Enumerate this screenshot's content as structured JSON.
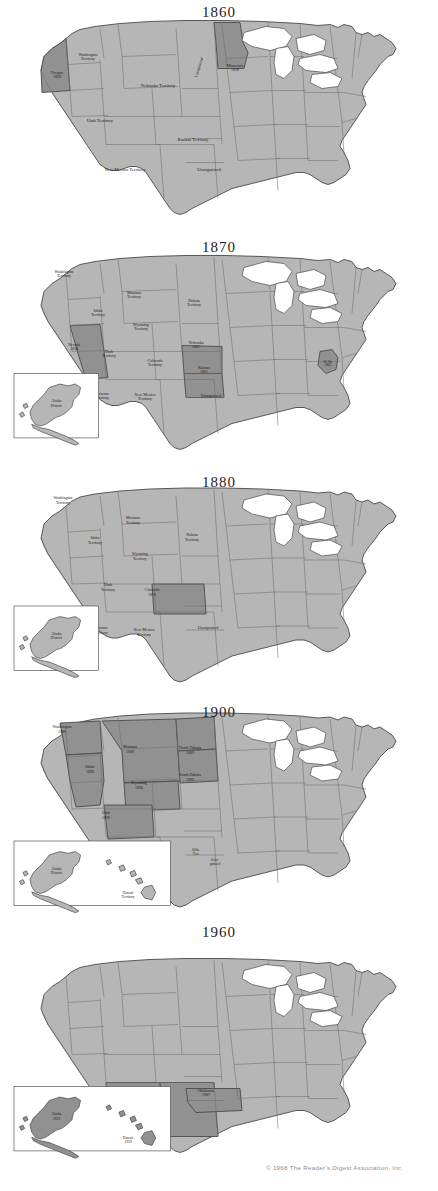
{
  "document": {
    "kind": "historical-map-series",
    "subject": "United States territorial and statehood expansion",
    "copyright": "© 1968 The Reader's Digest Association, Inc"
  },
  "colors": {
    "base_state_fill": "#b6b6b6",
    "highlight_fill": "#919191",
    "water_fill": "#ffffff",
    "border_stroke": "#6e6e6e",
    "outline_stroke": "#4a4a4a",
    "page_background": "#ffffff",
    "label_text": "#1c1c1c",
    "copyright_text": "#8d8d8d"
  },
  "maps": [
    {
      "id": "map-1860",
      "title": "1860",
      "has_alaska_inset": false,
      "has_hawaii_inset": false,
      "labels": [
        {
          "name": "washington-territory",
          "text": [
            "Washington",
            "Territory"
          ],
          "x": 88,
          "y": 42,
          "size": "xs",
          "highlight": false
        },
        {
          "name": "oregon",
          "text": [
            "Oregon",
            "1859"
          ],
          "x": 57,
          "y": 60,
          "size": "xs",
          "highlight": true
        },
        {
          "name": "nebraska-territory",
          "text": [
            "Nebraska Territory"
          ],
          "x": 158,
          "y": 73,
          "size": "sm",
          "highlight": false
        },
        {
          "name": "unorganized-vertical",
          "text": [
            "Unorganized"
          ],
          "x": 199,
          "y": 55,
          "size": "xs",
          "highlight": false,
          "rotate": -72
        },
        {
          "name": "minnesota",
          "text": [
            "Minnesota",
            "1858"
          ],
          "x": 235,
          "y": 53,
          "size": "xs",
          "highlight": true
        },
        {
          "name": "utah-territory",
          "text": [
            "Utah Territory"
          ],
          "x": 100,
          "y": 108,
          "size": "sm",
          "highlight": false
        },
        {
          "name": "kansas-territory",
          "text": [
            "Kansas Territory"
          ],
          "x": 193,
          "y": 127,
          "size": "sm",
          "highlight": false
        },
        {
          "name": "new-mexico-territory",
          "text": [
            "New Mexico Territory"
          ],
          "x": 125,
          "y": 157,
          "size": "sm",
          "highlight": false
        },
        {
          "name": "unorganized-south",
          "text": [
            "Unorganized"
          ],
          "x": 209,
          "y": 157,
          "size": "sm",
          "highlight": false
        }
      ]
    },
    {
      "id": "map-1870",
      "title": "1870",
      "has_alaska_inset": true,
      "has_hawaii_inset": false,
      "alaska_inset_label": [
        "Alaska",
        "District"
      ],
      "labels": [
        {
          "name": "washington-territory",
          "text": [
            "Washington",
            "Territory"
          ],
          "x": 64,
          "y": 24,
          "size": "xs",
          "highlight": false
        },
        {
          "name": "montana-territory",
          "text": [
            "Montana",
            "Territory"
          ],
          "x": 134,
          "y": 45,
          "size": "xs",
          "highlight": false
        },
        {
          "name": "dakota-territory",
          "text": [
            "Dakota",
            "Territory"
          ],
          "x": 194,
          "y": 53,
          "size": "xs",
          "highlight": false
        },
        {
          "name": "idaho-territory",
          "text": [
            "Idaho",
            "Territory"
          ],
          "x": 98,
          "y": 63,
          "size": "xs",
          "highlight": false
        },
        {
          "name": "wyoming-territory",
          "text": [
            "Wyoming",
            "Territory"
          ],
          "x": 141,
          "y": 77,
          "size": "xs",
          "highlight": false
        },
        {
          "name": "nevada",
          "text": [
            "Nevada",
            "1864"
          ],
          "x": 74,
          "y": 97,
          "size": "xs",
          "highlight": true
        },
        {
          "name": "utah-territory",
          "text": [
            "Utah",
            "Territory"
          ],
          "x": 109,
          "y": 104,
          "size": "xs",
          "highlight": false
        },
        {
          "name": "colorado-territory",
          "text": [
            "Colorado",
            "Territory"
          ],
          "x": 155,
          "y": 113,
          "size": "xs",
          "highlight": false
        },
        {
          "name": "nebraska",
          "text": [
            "Nebraska",
            "1867"
          ],
          "x": 196,
          "y": 95,
          "size": "xs",
          "highlight": true
        },
        {
          "name": "kansas",
          "text": [
            "Kansas",
            "1861"
          ],
          "x": 204,
          "y": 120,
          "size": "xs",
          "highlight": true
        },
        {
          "name": "west-virginia",
          "text": [
            "W. Va.",
            "1863"
          ],
          "x": 328,
          "y": 114,
          "size": "xxs",
          "highlight": true
        },
        {
          "name": "arizona-territory",
          "text": [
            "Arizona",
            "Territory"
          ],
          "x": 102,
          "y": 146,
          "size": "xs",
          "highlight": false
        },
        {
          "name": "new-mexico-territory",
          "text": [
            "New Mexico",
            "Territory"
          ],
          "x": 145,
          "y": 147,
          "size": "xs",
          "highlight": false
        },
        {
          "name": "unorganized",
          "text": [
            "Unorganized"
          ],
          "x": 211,
          "y": 148,
          "size": "xs",
          "highlight": false
        }
      ]
    },
    {
      "id": "map-1880",
      "title": "1880",
      "has_alaska_inset": true,
      "has_hawaii_inset": false,
      "alaska_inset_label": [
        "Alaska",
        "District"
      ],
      "labels": [
        {
          "name": "washington-territory",
          "text": [
            "Washington",
            "Territory"
          ],
          "x": 63,
          "y": 18,
          "size": "xs",
          "highlight": false
        },
        {
          "name": "montana-territory",
          "text": [
            "Montana",
            "Territory"
          ],
          "x": 133,
          "y": 38,
          "size": "xs",
          "highlight": false
        },
        {
          "name": "dakota-territory",
          "text": [
            "Dakota",
            "Territory"
          ],
          "x": 192,
          "y": 55,
          "size": "xs",
          "highlight": false
        },
        {
          "name": "idaho-territory",
          "text": [
            "Idaho",
            "Territory"
          ],
          "x": 95,
          "y": 58,
          "size": "xs",
          "highlight": false
        },
        {
          "name": "wyoming-territory",
          "text": [
            "Wyoming",
            "Territory"
          ],
          "x": 140,
          "y": 74,
          "size": "xs",
          "highlight": false
        },
        {
          "name": "utah-territory",
          "text": [
            "Utah",
            "Territory"
          ],
          "x": 108,
          "y": 105,
          "size": "xs",
          "highlight": false
        },
        {
          "name": "colorado",
          "text": [
            "Colorado",
            "1876"
          ],
          "x": 152,
          "y": 110,
          "size": "xs",
          "highlight": true
        },
        {
          "name": "arizona-territory",
          "text": [
            "Arizona",
            "Territory"
          ],
          "x": 101,
          "y": 148,
          "size": "xs",
          "highlight": false
        },
        {
          "name": "new-mexico-territory",
          "text": [
            "New Mexico",
            "Territory"
          ],
          "x": 144,
          "y": 150,
          "size": "xs",
          "highlight": false
        },
        {
          "name": "unorganized",
          "text": [
            "Unorganized"
          ],
          "x": 208,
          "y": 148,
          "size": "xs",
          "highlight": false
        }
      ]
    },
    {
      "id": "map-1900",
      "title": "1900",
      "has_alaska_inset": true,
      "has_hawaii_inset": true,
      "alaska_inset_label": [
        "Alaska",
        "District"
      ],
      "hawaii_inset_label": [
        "Hawaii",
        "Territory"
      ],
      "labels": [
        {
          "name": "washington",
          "text": [
            "Washington",
            "1889"
          ],
          "x": 62,
          "y": 22,
          "size": "xs",
          "highlight": true
        },
        {
          "name": "montana",
          "text": [
            "Montana",
            "1889"
          ],
          "x": 130,
          "y": 42,
          "size": "xs",
          "highlight": true
        },
        {
          "name": "north-dakota",
          "text": [
            "North Dakota",
            "1889"
          ],
          "x": 190,
          "y": 43,
          "size": "xs",
          "highlight": true
        },
        {
          "name": "idaho",
          "text": [
            "Idaho",
            "1890"
          ],
          "x": 90,
          "y": 62,
          "size": "xs",
          "highlight": true
        },
        {
          "name": "south-dakota",
          "text": [
            "South Dakota",
            "1889"
          ],
          "x": 190,
          "y": 70,
          "size": "xs",
          "highlight": true
        },
        {
          "name": "wyoming",
          "text": [
            "Wyoming",
            "1890"
          ],
          "x": 139,
          "y": 78,
          "size": "xs",
          "highlight": true
        },
        {
          "name": "utah",
          "text": [
            "Utah",
            "1896"
          ],
          "x": 106,
          "y": 108,
          "size": "xs",
          "highlight": true
        },
        {
          "name": "arizona-territory",
          "text": [
            "Arizona",
            "Territory"
          ],
          "x": 100,
          "y": 148,
          "size": "xs",
          "highlight": false
        },
        {
          "name": "new-mexico-territory",
          "text": [
            "New Mexico",
            "Territory"
          ],
          "x": 141,
          "y": 151,
          "size": "xs",
          "highlight": false
        },
        {
          "name": "oklahoma-territory",
          "text": [
            "Okla.",
            "Terr."
          ],
          "x": 196,
          "y": 145,
          "size": "xxs",
          "highlight": false
        },
        {
          "name": "unorganized",
          "text": [
            "Unor-",
            "ganized"
          ],
          "x": 215,
          "y": 155,
          "size": "xxs",
          "highlight": false
        }
      ]
    },
    {
      "id": "map-1960",
      "title": "1960",
      "has_alaska_inset": true,
      "has_hawaii_inset": true,
      "alaska_inset_label": [
        "Alaska",
        "1959"
      ],
      "hawaii_inset_label": [
        "Hawaii",
        "1959"
      ],
      "alaska_highlight": true,
      "hawaii_highlight": true,
      "labels": [
        {
          "name": "arizona",
          "text": [
            "Arizona",
            "1912"
          ],
          "x": 99,
          "y": 142,
          "size": "xs",
          "highlight": true
        },
        {
          "name": "new-mexico",
          "text": [
            "New Mexico",
            "1912"
          ],
          "x": 139,
          "y": 150,
          "size": "xs",
          "highlight": true
        },
        {
          "name": "oklahoma",
          "text": [
            "Oklahoma",
            "1907"
          ],
          "x": 206,
          "y": 140,
          "size": "xs",
          "highlight": true
        }
      ]
    }
  ]
}
